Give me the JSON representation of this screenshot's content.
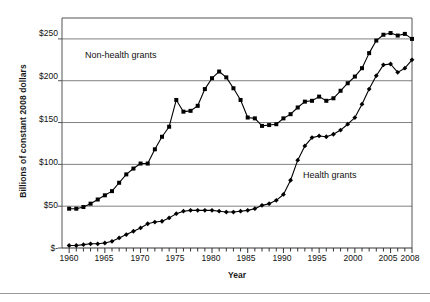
{
  "chart_data": {
    "type": "line",
    "title": "",
    "xlabel": "Year",
    "ylabel": "Billions of constant 2008 dollars",
    "xlim": [
      1959,
      2008
    ],
    "ylim": [
      0,
      275
    ],
    "grid": "horizontal",
    "legend_position": "inline-annotation",
    "y_ticks": [
      0,
      50,
      100,
      150,
      200,
      250
    ],
    "y_tick_labels": [
      "$-",
      "$50",
      "$100",
      "$150",
      "$200",
      "$250"
    ],
    "x_ticks": [
      1960,
      1965,
      1970,
      1975,
      1980,
      1985,
      1990,
      1995,
      2000,
      2005,
      2008
    ],
    "x_tick_labels": [
      "1960",
      "1965",
      "1970",
      "1975",
      "1980",
      "1985",
      "1990",
      "1995",
      "2000",
      "2005",
      "2008"
    ],
    "x_minor_tick_interval": 1,
    "x": [
      1960,
      1961,
      1962,
      1963,
      1964,
      1965,
      1966,
      1967,
      1968,
      1969,
      1970,
      1971,
      1972,
      1973,
      1974,
      1975,
      1976,
      1977,
      1978,
      1979,
      1980,
      1981,
      1982,
      1983,
      1984,
      1985,
      1986,
      1987,
      1988,
      1989,
      1990,
      1991,
      1992,
      1993,
      1994,
      1995,
      1996,
      1997,
      1998,
      1999,
      2000,
      2001,
      2002,
      2003,
      2004,
      2005,
      2006,
      2007,
      2008
    ],
    "series": [
      {
        "name": "Non-health grants",
        "marker": "square",
        "color": "#000000",
        "values": [
          47,
          47,
          49,
          53,
          58,
          63,
          68,
          78,
          88,
          95,
          101,
          101,
          118,
          133,
          145,
          177,
          163,
          164,
          170,
          190,
          203,
          211,
          204,
          191,
          177,
          156,
          155,
          146,
          147,
          148,
          155,
          160,
          168,
          175,
          176,
          181,
          176,
          179,
          188,
          197,
          205,
          215,
          233,
          248,
          255,
          257,
          254,
          256,
          250
        ]
      },
      {
        "name": "Health grants",
        "marker": "diamond",
        "color": "#000000",
        "values": [
          3,
          3,
          4,
          5,
          5,
          6,
          8,
          12,
          16,
          20,
          24,
          29,
          31,
          32,
          36,
          41,
          44,
          45,
          45,
          45,
          45,
          44,
          43,
          43,
          44,
          45,
          47,
          51,
          53,
          57,
          64,
          81,
          105,
          122,
          132,
          134,
          133,
          136,
          141,
          148,
          156,
          172,
          190,
          206,
          219,
          220,
          210,
          215,
          225
        ]
      }
    ],
    "annotations": [
      {
        "text": "Non-health grants",
        "x": 1966,
        "y": 224
      },
      {
        "text": "Health grants",
        "x": 1996,
        "y": 62
      }
    ]
  }
}
